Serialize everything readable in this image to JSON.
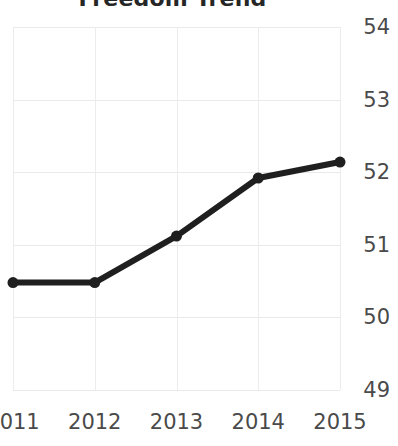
{
  "chart_data": {
    "type": "line",
    "title": "Freedom Trend",
    "xlabel": "",
    "ylabel": "",
    "categories": [
      "2011",
      "2012",
      "2013",
      "2014",
      "2015"
    ],
    "x": [
      2011,
      2012,
      2013,
      2014,
      2015
    ],
    "values": [
      50.48,
      50.48,
      51.12,
      51.92,
      52.14
    ],
    "series": [
      {
        "name": "Freedom Trend",
        "values": [
          50.48,
          50.48,
          51.12,
          51.92,
          52.14
        ]
      }
    ],
    "ylim": [
      49,
      54
    ],
    "yticks": [
      54,
      53,
      52,
      51,
      50,
      49
    ],
    "ytick_labels": [
      "54",
      "53",
      "52",
      "51",
      "50",
      "49"
    ],
    "xticks": [
      2011,
      2012,
      2013,
      2014,
      2015
    ],
    "xtick_labels": [
      "2011",
      "2012",
      "2013",
      "2014",
      "2015"
    ],
    "grid": true,
    "y_axis_position": "right",
    "legend": false,
    "legend_position": "none",
    "marker": "circle",
    "line_color": "#1f1f1f",
    "marker_color": "#1f1f1f",
    "grid_color": "#e9e9e9",
    "background_color": "#ffffff",
    "text_color": "#4a4a4a",
    "title_color": "#262626"
  }
}
